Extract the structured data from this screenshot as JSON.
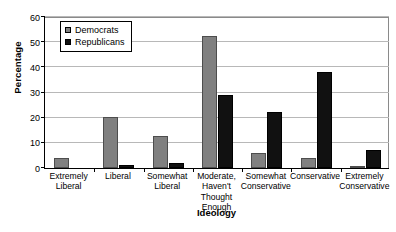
{
  "chart_data": {
    "type": "bar",
    "title": "",
    "xlabel": "Ideology",
    "ylabel": "Percentage",
    "ylim": [
      0,
      60
    ],
    "yticks": [
      0,
      10,
      20,
      30,
      40,
      50,
      60
    ],
    "grid": true,
    "legend_position": "top-left-inside",
    "categories": [
      "Extremely\nLiberal",
      "Liberal",
      "Somewhat\nLiberal",
      "Moderate,\nHaven't\nThought\nEnough",
      "Somewhat\nConservative",
      "Conservative",
      "Extremely\nConservative"
    ],
    "category_lines": [
      [
        "Extremely",
        "Liberal"
      ],
      [
        "Liberal"
      ],
      [
        "Somewhat",
        "Liberal"
      ],
      [
        "Moderate,",
        "Haven't",
        "Thought",
        "Enough"
      ],
      [
        "Somewhat",
        "Conservative"
      ],
      [
        "Conservative"
      ],
      [
        "Extremely",
        "Conservative"
      ]
    ],
    "series": [
      {
        "name": "Democrats",
        "color": "#808080",
        "values": [
          4,
          20,
          12.5,
          52,
          6,
          4,
          0.5
        ]
      },
      {
        "name": "Republicans",
        "color": "#111111",
        "values": [
          0,
          1,
          2,
          29,
          22,
          38,
          7
        ]
      }
    ]
  },
  "legend": {
    "items": [
      {
        "label": "Democrats",
        "swatch": "legend-swatch-democrats"
      },
      {
        "label": "Republicans",
        "swatch": "legend-swatch-republicans"
      }
    ]
  },
  "axes": {
    "y_title": "Percentage",
    "x_title": "Ideology",
    "y_tick_labels": [
      "0",
      "10",
      "20",
      "30",
      "40",
      "50",
      "60"
    ]
  }
}
